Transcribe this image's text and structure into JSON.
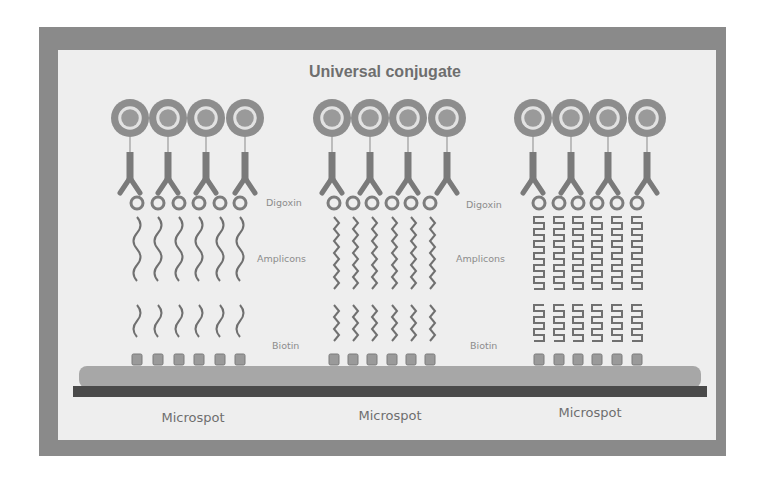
{
  "title": "Universal conjugate",
  "colors": {
    "frame": "#8a8a8a",
    "panel": "#eeeeee",
    "conjugate_outer": "#8d8d8d",
    "conjugate_ring": "#e2e2e2",
    "conjugate_core": "#9a9a9a",
    "antibody": "#7a7a7a",
    "digoxin": "#7d7d7d",
    "amplicon": "#707070",
    "biotin_box": "#9a9a9a",
    "surface_layer": "#a7a7a7",
    "baseline": "#4a4a4a",
    "text": "#6e6e6e"
  },
  "layout": {
    "conjugate_y": 118,
    "conjugate_r": 19,
    "antibody_top": 152,
    "antibody_fork": 180,
    "antibody_tip": 193,
    "digoxin_y": 203,
    "digoxin_r": 6,
    "amplicon_top_start": 217,
    "amplicon_top_end": 290,
    "amplicon_bottom_start": 305,
    "amplicon_bottom_end": 354,
    "biotin_y": 354,
    "surface_top": 366,
    "baseline_y": 386,
    "baseline_h": 11,
    "baseline_x1": 73,
    "baseline_x2": 707
  },
  "groups": [
    {
      "id": "left",
      "amplicon_style": "arc",
      "conjugate_x": [
        130,
        168,
        206,
        245
      ],
      "strand_x": [
        137,
        158,
        179,
        199,
        220,
        240
      ],
      "microspot_label": "Microspot",
      "microspot_x": 193,
      "microspot_y": 422
    },
    {
      "id": "middle",
      "amplicon_style": "zigzag",
      "conjugate_x": [
        332,
        370,
        408,
        447
      ],
      "strand_x": [
        334,
        353,
        372,
        392,
        411,
        430
      ],
      "microspot_label": "Microspot",
      "microspot_x": 390,
      "microspot_y": 420
    },
    {
      "id": "right",
      "amplicon_style": "square",
      "conjugate_x": [
        533,
        571,
        608,
        647
      ],
      "strand_x": [
        539,
        559,
        578,
        597,
        617,
        637
      ],
      "microspot_label": "Microspot",
      "microspot_x": 590,
      "microspot_y": 417
    }
  ],
  "side_labels": [
    {
      "text": "Digoxin",
      "x": 266,
      "y": 206
    },
    {
      "text": "Amplicons",
      "x": 257,
      "y": 262
    },
    {
      "text": "Biotin",
      "x": 272,
      "y": 349
    },
    {
      "text": "Digoxin",
      "x": 466,
      "y": 208
    },
    {
      "text": "Amplicons",
      "x": 456,
      "y": 262
    },
    {
      "text": "Biotin",
      "x": 470,
      "y": 349
    }
  ]
}
